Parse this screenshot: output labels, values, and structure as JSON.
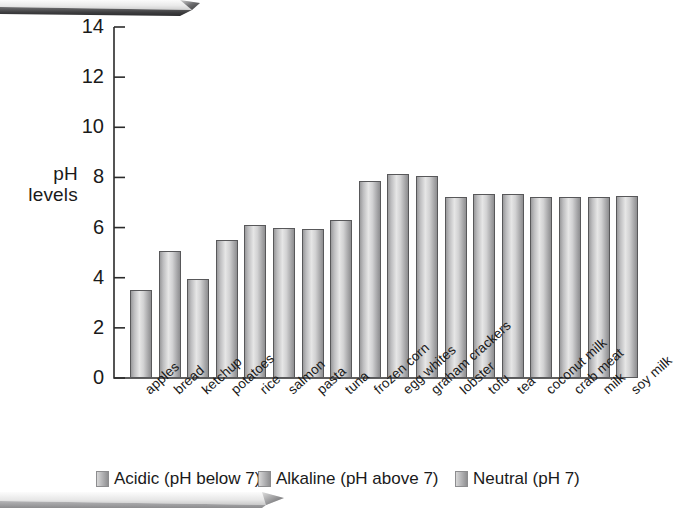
{
  "chart_data": {
    "type": "bar",
    "title": "",
    "subtitle": "",
    "xlabel": "",
    "ylabel": "pH levels",
    "ylim": [
      0,
      14
    ],
    "ytick_labels": [
      "0",
      "2",
      "4",
      "6",
      "8",
      "10",
      "12",
      "14"
    ],
    "ytick_values": [
      0,
      2,
      4,
      6,
      8,
      10,
      12,
      14
    ],
    "grid": false,
    "legend_position": "bottom",
    "categories": [
      "apples",
      "bread",
      "ketchup",
      "potatoes",
      "rice",
      "salmon",
      "pasta",
      "tuna",
      "frozen corn",
      "egg whites",
      "graham crackers",
      "lobster",
      "tofu",
      "tea",
      "coconut milk",
      "crab meat",
      "milk",
      "soy milk"
    ],
    "values": [
      3.5,
      5.05,
      3.95,
      5.5,
      6.1,
      6.0,
      5.95,
      6.3,
      7.85,
      8.15,
      8.05,
      7.2,
      7.35,
      7.35,
      7.2,
      7.2,
      7.2,
      7.25
    ],
    "legend": [
      "Acidic (pH below 7)",
      "Alkaline (pH above 7)",
      "Neutral (pH 7)"
    ],
    "colors": {
      "bar_light": "#e6e6e6",
      "bar_mid": "#bdbdbf",
      "bar_dark": "#8e8e90",
      "bar_outline": "#58585a",
      "axis": "#2b2b2b",
      "text": "#1a1a1a",
      "banner_light": "#f2f2f2",
      "banner_dark": "#4a4a4c"
    }
  },
  "decor": {
    "banner_top_name": "top-ribbon",
    "banner_bottom_name": "bottom-ribbon"
  }
}
